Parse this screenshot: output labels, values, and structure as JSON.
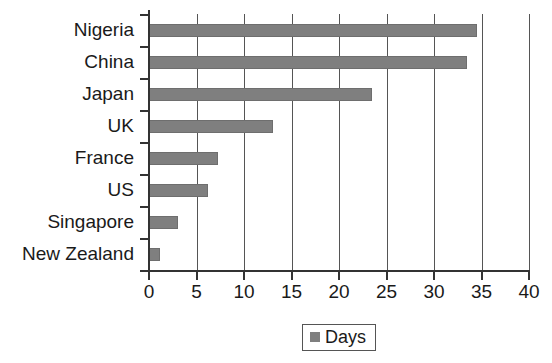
{
  "chart_data": {
    "type": "bar",
    "orientation": "horizontal",
    "title": "",
    "xlabel": "",
    "ylabel": "",
    "categories": [
      "Nigeria",
      "China",
      "Japan",
      "UK",
      "France",
      "US",
      "Singapore",
      "New Zealand"
    ],
    "values": [
      34.5,
      33.5,
      23.5,
      13,
      7.3,
      6.2,
      3,
      1.2
    ],
    "series": [
      {
        "name": "Days",
        "values": [
          34.5,
          33.5,
          23.5,
          13,
          7.3,
          6.2,
          3,
          1.2
        ]
      }
    ],
    "xlim": [
      0,
      40
    ],
    "xticks": [
      0,
      5,
      10,
      15,
      20,
      25,
      30,
      35,
      40
    ],
    "xtick_labels": [
      "0",
      "5",
      "10",
      "15",
      "20",
      "25",
      "30",
      "35",
      "40"
    ],
    "grid": "vertical",
    "legend": {
      "position": "bottom-center",
      "entries": [
        "Days"
      ]
    },
    "colors": {
      "bar": "#7f7f7f",
      "axis": "#333333",
      "gridline": "#555555",
      "text": "#1a1a1a",
      "background": "#ffffff"
    }
  }
}
